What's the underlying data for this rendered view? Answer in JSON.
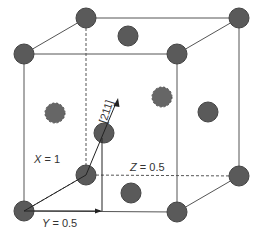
{
  "diagram": {
    "colors": {
      "line": "#555555",
      "atom": "#5a5a5a",
      "atom_stroke": "#444444",
      "text": "#333333"
    },
    "labels": {
      "x_axis_var": "X",
      "x_axis_eq": " = 1",
      "y_axis_var": "Y",
      "y_axis_eq": " = 0.5",
      "z_axis_var": "Z",
      "z_axis_eq": " = 0.5",
      "direction": "[211]"
    },
    "atoms": [
      {
        "name": "corner-back-top-left",
        "x": 86,
        "y": 18,
        "hidden": false
      },
      {
        "name": "corner-back-top-right",
        "x": 239,
        "y": 18,
        "hidden": false
      },
      {
        "name": "corner-front-top-left",
        "x": 24,
        "y": 54,
        "hidden": false
      },
      {
        "name": "corner-front-top-right",
        "x": 177,
        "y": 54,
        "hidden": false
      },
      {
        "name": "face-top",
        "x": 128,
        "y": 36,
        "hidden": false
      },
      {
        "name": "face-left",
        "x": 55,
        "y": 113,
        "hidden": true
      },
      {
        "name": "face-back",
        "x": 162,
        "y": 97,
        "hidden": true
      },
      {
        "name": "face-right",
        "x": 208,
        "y": 112,
        "hidden": false
      },
      {
        "name": "face-front",
        "x": 104,
        "y": 133,
        "hidden": false
      },
      {
        "name": "corner-back-bottom-left",
        "x": 86,
        "y": 175,
        "hidden": false
      },
      {
        "name": "corner-back-bottom-right",
        "x": 239,
        "y": 176,
        "hidden": false
      },
      {
        "name": "face-bottom",
        "x": 131,
        "y": 193,
        "hidden": false
      },
      {
        "name": "corner-front-bottom-left",
        "x": 24,
        "y": 211,
        "hidden": false
      },
      {
        "name": "corner-front-bottom-right",
        "x": 177,
        "y": 212,
        "hidden": false
      }
    ]
  }
}
